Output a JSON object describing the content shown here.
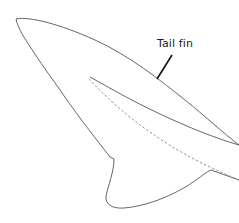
{
  "diagram": {
    "labels": [
      {
        "text": "Tail fin",
        "target": "upper-lobe"
      }
    ],
    "colors": {
      "outline": "#555555",
      "leader_line": "#111111",
      "background": "#ffffff"
    }
  }
}
